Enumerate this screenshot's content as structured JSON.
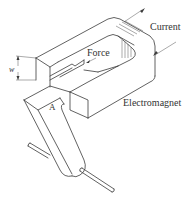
{
  "diagram": {
    "type": "technical-illustration",
    "labels": {
      "current": "Current",
      "force": "Force",
      "electromagnet": "Electromagnet",
      "armature": "A",
      "width": "w"
    },
    "colors": {
      "line": "#3a3a3a",
      "text": "#333333",
      "background": "#ffffff"
    }
  }
}
